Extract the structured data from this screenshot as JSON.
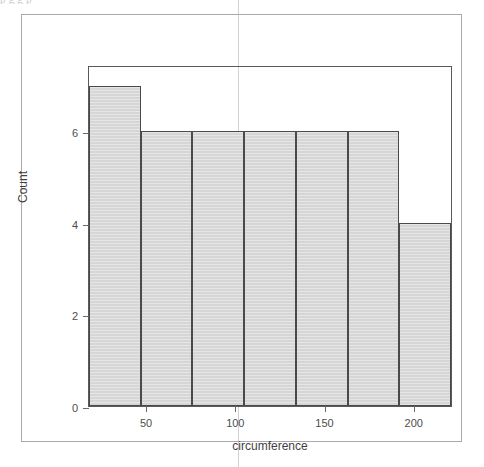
{
  "page": {
    "clipped_top_text": "p   g                              g   p",
    "background_color": "#ffffff",
    "frame_border_color": "#a9a9af",
    "scan_line_color": "#c9c9cf"
  },
  "chart_data": {
    "type": "bar",
    "title": "",
    "subtitle": "",
    "xlabel": "circumference",
    "ylabel": "Count",
    "xlim": [
      18,
      222
    ],
    "ylim": [
      0,
      7.45
    ],
    "grid": false,
    "legend": null,
    "bar_style": {
      "fill_color": "#d6d6d6",
      "border_color": "#4a4a4a"
    },
    "bin_width": 29,
    "bin_edges": [
      18,
      47,
      76,
      105,
      134,
      163,
      192,
      221
    ],
    "categories": [
      "18-47",
      "47-76",
      "76-105",
      "105-134",
      "134-163",
      "163-192",
      "192-221"
    ],
    "values": [
      7,
      6,
      6,
      6,
      6,
      6,
      4
    ],
    "bars": [
      {
        "x0": 18,
        "x1": 47,
        "count": 7
      },
      {
        "x0": 47,
        "x1": 76,
        "count": 6
      },
      {
        "x0": 76,
        "x1": 105,
        "count": 6
      },
      {
        "x0": 105,
        "x1": 134,
        "count": 6
      },
      {
        "x0": 134,
        "x1": 163,
        "count": 6
      },
      {
        "x0": 163,
        "x1": 192,
        "count": 6
      },
      {
        "x0": 192,
        "x1": 221,
        "count": 4
      }
    ],
    "xticks": [
      50,
      100,
      150,
      200
    ],
    "xticklabels": [
      "50",
      "100",
      "150",
      "200"
    ],
    "yticks": [
      0,
      2,
      4,
      6
    ],
    "yticklabels": [
      "0",
      "2",
      "4",
      "6"
    ],
    "total_count": 41
  }
}
